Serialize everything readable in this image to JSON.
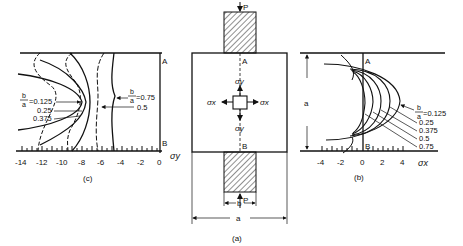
{
  "figure": {
    "panel_a": {
      "caption": "(a)",
      "load_top": "P",
      "load_bottom": "P",
      "point_a": "A",
      "point_b": "B",
      "sigma_y_top": "σy",
      "sigma_y_bottom": "σy",
      "sigma_x_left": "σx",
      "sigma_x_right": "σx",
      "dim_b": "b",
      "dim_a": "a"
    },
    "panel_b": {
      "caption": "(b)",
      "axis_label": "σx",
      "dim_a": "a",
      "point_a": "A",
      "point_b": "B",
      "ratio_label_num": "b",
      "ratio_label_den": "a",
      "curve_labels": [
        "=0.125",
        "0.25",
        "0.375",
        "0.5",
        "0.75"
      ],
      "ticks": [
        "-4",
        "-2",
        "0",
        "2",
        "4"
      ]
    },
    "panel_c": {
      "caption": "(c)",
      "axis_label": "σy",
      "point_a": "A",
      "point_b": "B",
      "ratio_label_num": "b",
      "ratio_label_den": "a",
      "left_labels": [
        "=0.125",
        "0.25",
        "0.375"
      ],
      "right_labels": [
        "=0.75",
        "0.5"
      ],
      "ticks": [
        "-14",
        "-12",
        "-10",
        "-8",
        "-6",
        "-4",
        "-2",
        "0"
      ]
    }
  }
}
